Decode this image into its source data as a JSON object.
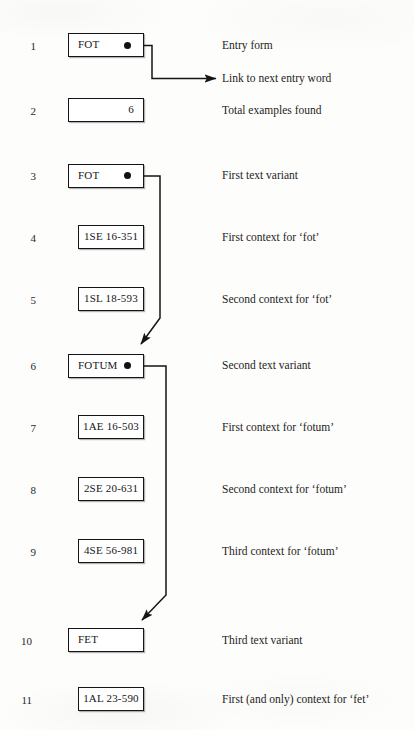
{
  "diagram": {
    "rows": [
      {
        "num": "1",
        "box": "FOT",
        "box_style": "wide-left",
        "has_dot": true,
        "desc": "Entry form"
      },
      {
        "num": "",
        "box": null,
        "box_style": null,
        "has_dot": false,
        "desc": "Link to next entry word"
      },
      {
        "num": "2",
        "box": "6",
        "box_style": "wide-right",
        "has_dot": false,
        "desc": "Total examples found"
      },
      {
        "num": "3",
        "box": "FOT",
        "box_style": "wide-left",
        "has_dot": true,
        "desc": "First text variant"
      },
      {
        "num": "4",
        "box": "1SE 16-351",
        "box_style": "narrow",
        "has_dot": false,
        "desc": "First context for ‘fot’"
      },
      {
        "num": "5",
        "box": "1SL 18-593",
        "box_style": "narrow",
        "has_dot": false,
        "desc": "Second context for ‘fot’"
      },
      {
        "num": "6",
        "box": "FOTUM",
        "box_style": "wide-left",
        "has_dot": true,
        "desc": "Second text variant"
      },
      {
        "num": "7",
        "box": "1AE 16-503",
        "box_style": "narrow",
        "has_dot": false,
        "desc": "First context for ‘fotum’"
      },
      {
        "num": "8",
        "box": "2SE 20-631",
        "box_style": "narrow",
        "has_dot": false,
        "desc": "Second context for ‘fotum’"
      },
      {
        "num": "9",
        "box": "4SE 56-981",
        "box_style": "narrow",
        "has_dot": false,
        "desc": "Third context for ‘fotum’"
      },
      {
        "num": "10",
        "box": "FET",
        "box_style": "wide-left",
        "has_dot": false,
        "desc": "Third text variant"
      },
      {
        "num": "11",
        "box": "1AL 23-590",
        "box_style": "narrow",
        "has_dot": false,
        "desc": "First (and only) context for ‘fet’"
      }
    ],
    "colors": {
      "ink": "#151515",
      "paper": "#fdfdfc",
      "dot": "#111111"
    }
  }
}
